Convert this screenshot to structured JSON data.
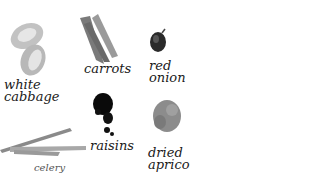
{
  "items": [
    {
      "name": "white-cabbage",
      "label_line1": "white",
      "label_line2": "cabbage"
    },
    {
      "name": "carrots",
      "label_line1": "carrots"
    },
    {
      "name": "red-onion",
      "label_line1": "red",
      "label_line2": "onion"
    },
    {
      "name": "raisins",
      "label_line1": "raisins"
    },
    {
      "name": "celery",
      "label_line1": "celery"
    },
    {
      "name": "dried-apricots",
      "label_line1": "dried",
      "label_line2": "apricots"
    }
  ],
  "colors": {
    "background": "#ffffff",
    "text": "#1a1a1a",
    "cabbage": "#bdbdbd",
    "carrots": "#8a8a8a",
    "onion": "#2a2a2a",
    "raisins": "#0a0a0a",
    "celery": "#9a9a9a",
    "apricots": "#8c8c8c"
  }
}
